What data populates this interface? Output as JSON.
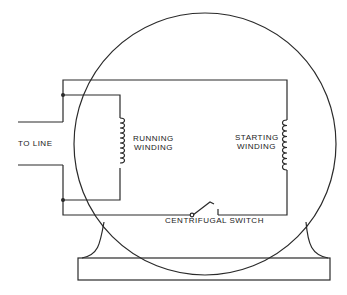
{
  "diagram": {
    "type": "split-phase induction motor wiring",
    "labels": {
      "to_line": "TO LINE",
      "running_winding_1": "RUNNING",
      "running_winding_2": "WINDING",
      "starting_winding_1": "STARTING",
      "starting_winding_2": "WINDING",
      "centrifugal_switch": "CENTRIFUGAL SWITCH"
    },
    "colors": {
      "line": "#2a2a2a",
      "background": "#ffffff"
    }
  }
}
